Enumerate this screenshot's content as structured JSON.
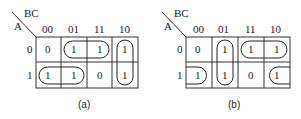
{
  "maps": [
    {
      "id": "a",
      "caption": "(a)",
      "col_var": "BC",
      "row_var": "A",
      "col_labels": [
        "00",
        "01",
        "11",
        "10"
      ],
      "row_labels": [
        "0",
        "1"
      ],
      "cells": [
        [
          "0",
          "1",
          "1",
          "1"
        ],
        [
          "1",
          "1",
          "0",
          "1"
        ]
      ],
      "groups": [
        "A=0 BC=01,11",
        "A=1 BC=00,01",
        "A=0,1 BC=10"
      ]
    },
    {
      "id": "b",
      "caption": "(b)",
      "col_var": "BC",
      "row_var": "A",
      "col_labels": [
        "00",
        "01",
        "11",
        "10"
      ],
      "row_labels": [
        "0",
        "1"
      ],
      "cells": [
        [
          "0",
          "1",
          "1",
          "1"
        ],
        [
          "1",
          "1",
          "0",
          "1"
        ]
      ],
      "groups": [
        "A=0,1 BC=01",
        "A=0 BC=11,10",
        "A=1 BC=00,10 (wrap-around)"
      ]
    }
  ]
}
